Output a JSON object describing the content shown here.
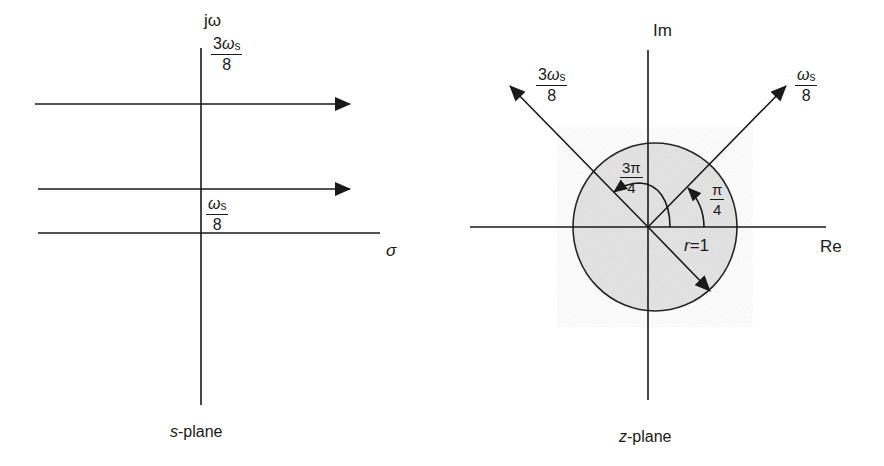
{
  "s_plane": {
    "caption_var": "s",
    "caption_rest": "-plane",
    "vertical_axis_label": "jω",
    "horizontal_axis_label": "σ",
    "line_upper": {
      "num_coef": "3",
      "num_sym": "ω",
      "num_sub": "s",
      "den": "8"
    },
    "line_lower": {
      "num_coef": "",
      "num_sym": "ω",
      "num_sub": "s",
      "den": "8"
    }
  },
  "z_plane": {
    "caption_var": "z",
    "caption_rest": "-plane",
    "vertical_axis_label": "Im",
    "horizontal_axis_label": "Re",
    "ray_left": {
      "num_coef": "3",
      "num_sym": "ω",
      "num_sub": "s",
      "den": "8"
    },
    "ray_right": {
      "num_coef": "",
      "num_sym": "ω",
      "num_sub": "s",
      "den": "8"
    },
    "angle_large": {
      "num": "3π",
      "den": "4"
    },
    "angle_small": {
      "num": "π",
      "den": "4"
    },
    "radius_label_var": "r",
    "radius_label_rest": "=1"
  },
  "colors": {
    "ink": "#1a1a1a",
    "unit_disc_fill": "#e4e4e4"
  }
}
